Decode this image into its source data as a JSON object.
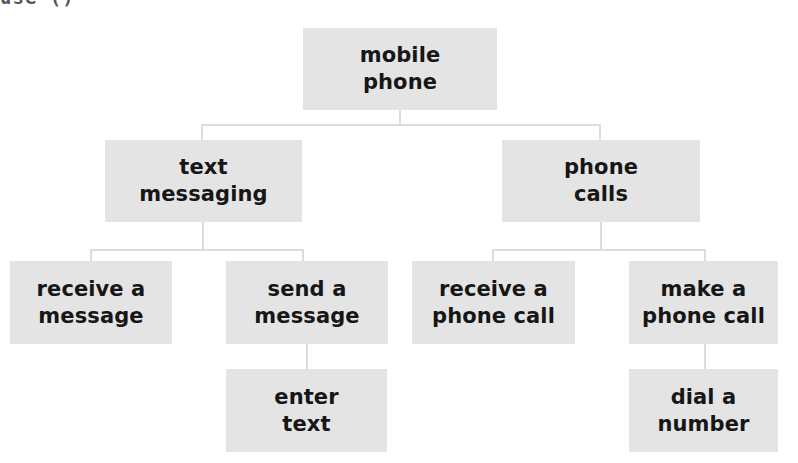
{
  "page": {
    "clipped_header_text": "use ()",
    "background_color": "#ffffff",
    "node_fill_color": "#e4e4e4",
    "node_text_color": "#161616",
    "connector_color": "#dcdcdc"
  },
  "diagram": {
    "type": "hierarchy-tree",
    "title": "mobile phone",
    "levels": 4,
    "nodes": {
      "root": {
        "label": "mobile\nphone",
        "level": 1
      },
      "text_messaging": {
        "label": "text\nmessaging",
        "level": 2
      },
      "phone_calls": {
        "label": "phone\ncalls",
        "level": 2
      },
      "receive_a_message": {
        "label": "receive a\nmessage",
        "level": 3
      },
      "send_a_message": {
        "label": "send a\nmessage",
        "level": 3
      },
      "receive_a_phone_call": {
        "label": "receive a\nphone call",
        "level": 3
      },
      "make_a_phone_call": {
        "label": "make a\nphone call",
        "level": 3
      },
      "enter_text": {
        "label": "enter\ntext",
        "level": 4
      },
      "dial_a_number": {
        "label": "dial a\nnumber",
        "level": 4
      }
    }
  }
}
